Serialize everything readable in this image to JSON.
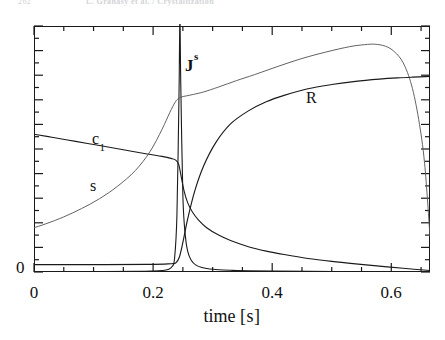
{
  "runhead": {
    "page_number": "262",
    "title": "L. Gránásy et al. / Crystallization"
  },
  "figure": {
    "curve_labels": {
      "flux": "J",
      "flux_sup": "s",
      "concentration": "c",
      "concentration_sub": "1",
      "supersaturation": "s",
      "radius": "R"
    },
    "axes": {
      "x_title_word": "time",
      "x_title_unit": "[s]",
      "x_ticks": [
        "0",
        "0.2",
        "0.4",
        "0.6"
      ],
      "y_ticks": [
        "0"
      ]
    }
  },
  "chart_data": {
    "type": "line",
    "title": "",
    "xlabel": "time [s]",
    "ylabel": "",
    "xlim": [
      0,
      0.665
    ],
    "ylim": [
      0,
      1
    ],
    "grid": false,
    "legend": "inline-annotations",
    "x_ticks_major": [
      0,
      0.2,
      0.4,
      0.6
    ],
    "x_ticks_minor": [
      0.05,
      0.1,
      0.15,
      0.25,
      0.3,
      0.35,
      0.45,
      0.5,
      0.55,
      0.65
    ],
    "y_ticks_major": [
      0
    ],
    "y_axis_labeled_only_at_zero": true,
    "series": [
      {
        "name": "J",
        "superscript": "s",
        "description": "nucleation rate - sharp spike at t = 0.245 s",
        "color": "#1a1a1a",
        "linewidth": 1.1,
        "x": [
          0.0,
          0.1,
          0.18,
          0.2,
          0.215,
          0.225,
          0.232,
          0.236,
          0.24,
          0.2435,
          0.245,
          0.2465,
          0.25,
          0.254,
          0.258,
          0.264,
          0.272,
          0.282,
          0.295,
          0.31,
          0.33,
          0.36,
          0.4,
          0.46,
          0.53,
          0.6,
          0.665
        ],
        "y": [
          0.002,
          0.002,
          0.003,
          0.004,
          0.006,
          0.01,
          0.022,
          0.055,
          0.23,
          0.72,
          1.03,
          0.76,
          0.31,
          0.15,
          0.085,
          0.048,
          0.028,
          0.018,
          0.012,
          0.009,
          0.007,
          0.005,
          0.004,
          0.003,
          0.002,
          0.002,
          0.002
        ]
      },
      {
        "name": "c",
        "subscript": "1",
        "description": "monomer concentration - slow linear decay then sharp drop at the nucleation burst, then long tail to zero",
        "color": "#1a1a1a",
        "linewidth": 1.1,
        "x": [
          0.0,
          0.03,
          0.07,
          0.11,
          0.15,
          0.19,
          0.215,
          0.23,
          0.238,
          0.243,
          0.247,
          0.252,
          0.258,
          0.266,
          0.276,
          0.29,
          0.31,
          0.33,
          0.36,
          0.39,
          0.42,
          0.46,
          0.5,
          0.54,
          0.58,
          0.62,
          0.665
        ],
        "y": [
          0.56,
          0.548,
          0.531,
          0.514,
          0.497,
          0.48,
          0.47,
          0.462,
          0.455,
          0.437,
          0.39,
          0.33,
          0.282,
          0.244,
          0.212,
          0.18,
          0.15,
          0.128,
          0.103,
          0.085,
          0.071,
          0.055,
          0.043,
          0.033,
          0.024,
          0.015,
          0.006
        ]
      },
      {
        "name": "s",
        "description": "supersaturation - exponential rise, plateau through the burst, broad maximum at t = 0.57 s, then steep collapse",
        "color": "#5a5a5a",
        "linewidth": 0.95,
        "x": [
          0.0,
          0.02,
          0.05,
          0.08,
          0.11,
          0.14,
          0.17,
          0.195,
          0.215,
          0.228,
          0.237,
          0.243,
          0.248,
          0.256,
          0.268,
          0.285,
          0.31,
          0.34,
          0.37,
          0.41,
          0.45,
          0.49,
          0.53,
          0.555,
          0.572,
          0.59,
          0.605,
          0.62,
          0.634,
          0.646,
          0.656,
          0.665
        ],
        "y": [
          0.18,
          0.196,
          0.224,
          0.258,
          0.298,
          0.348,
          0.412,
          0.49,
          0.58,
          0.648,
          0.69,
          0.706,
          0.712,
          0.716,
          0.722,
          0.732,
          0.752,
          0.778,
          0.802,
          0.836,
          0.868,
          0.894,
          0.916,
          0.924,
          0.926,
          0.918,
          0.896,
          0.85,
          0.76,
          0.62,
          0.44,
          0.145
        ]
      },
      {
        "name": "R",
        "description": "mean particle radius - zero until the nucleation burst then sigmoidal growth to a plateau",
        "color": "#1a1a1a",
        "linewidth": 1.15,
        "x": [
          0.0,
          0.12,
          0.19,
          0.225,
          0.238,
          0.244,
          0.25,
          0.258,
          0.27,
          0.285,
          0.305,
          0.33,
          0.36,
          0.39,
          0.42,
          0.46,
          0.5,
          0.54,
          0.58,
          0.61,
          0.635,
          0.665
        ],
        "y": [
          0.03,
          0.03,
          0.031,
          0.033,
          0.037,
          0.06,
          0.12,
          0.215,
          0.33,
          0.432,
          0.525,
          0.602,
          0.655,
          0.692,
          0.718,
          0.745,
          0.762,
          0.775,
          0.784,
          0.789,
          0.792,
          0.795
        ]
      }
    ]
  }
}
